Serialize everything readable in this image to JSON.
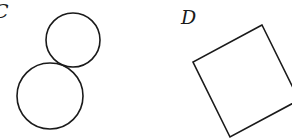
{
  "figures": [
    {
      "label": "C",
      "shape": "two tangent circles",
      "circles": [
        {
          "cx": 73,
          "cy": 40,
          "r": 27
        },
        {
          "cx": 50,
          "cy": 96,
          "r": 33
        }
      ]
    },
    {
      "label": "D",
      "shape": "rotated square",
      "points": "262,25 193,62 230,137 299,100"
    }
  ],
  "colors": {
    "stroke": "#1a1a1a",
    "background": "#ffffff"
  }
}
